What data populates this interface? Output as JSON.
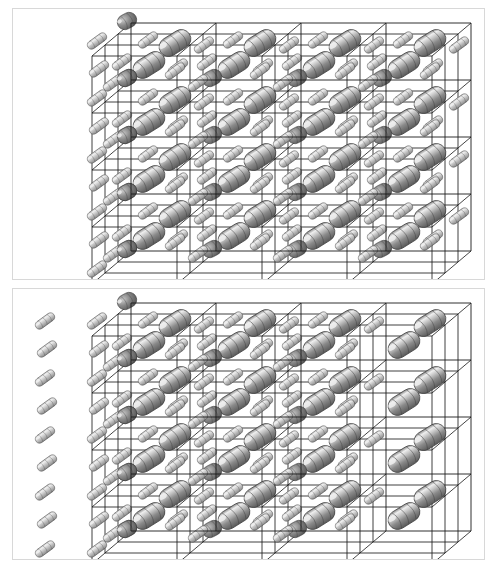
{
  "figure": {
    "title": "Crystal lattice packing diagrams",
    "width_px": 497,
    "height_px": 568,
    "background_color": "#ffffff",
    "frame_color": "#d8d8d8",
    "lattice_line_color": "#1a1a1a",
    "molecule_colors": {
      "body_dark": "#5a5a5a",
      "body_mid": "#8a8a8a",
      "body_light": "#c9c9c9",
      "highlight": "#efefef",
      "outline": "#3d3d3d",
      "node_dark": "#555555"
    }
  },
  "panels": [
    {
      "id": "panel-top",
      "label": "Upper packing diagram",
      "cells_across": 4,
      "cells_down": 4,
      "depth_layers": 4,
      "origin_x": 118,
      "origin_y": 14,
      "cell_w": 85,
      "cell_h": 57,
      "depth_dx": -13,
      "depth_dy": 11,
      "depth_step": 4,
      "big_rod": {
        "length": 34,
        "radius": 9.5,
        "angle_deg": -32,
        "offset_x": 44,
        "offset_y": 20,
        "bands": 4
      },
      "small_rod": {
        "length": 22,
        "radius": 4.2,
        "angle_deg": -36,
        "offset_x": 4,
        "offset_y": 34,
        "bands": 4
      },
      "node_rod": {
        "length": 20,
        "radius": 7.5,
        "angle_deg": -28,
        "offset_x": -4,
        "offset_y": -2,
        "bands": 3
      },
      "outside_small_rods": true,
      "outside_small_rod_columns": 1
    },
    {
      "id": "panel-bottom",
      "label": "Lower packing diagram",
      "cells_across": 4,
      "cells_down": 4,
      "depth_layers": 4,
      "origin_x": 118,
      "origin_y": 14,
      "cell_w": 85,
      "cell_h": 57,
      "depth_dx": -13,
      "depth_dy": 11,
      "depth_step": 4,
      "big_rod": {
        "length": 34,
        "radius": 9.5,
        "angle_deg": -32,
        "offset_x": 44,
        "offset_y": 20,
        "bands": 4
      },
      "small_rod": {
        "length": 22,
        "radius": 4.2,
        "angle_deg": -36,
        "offset_x": 4,
        "offset_y": 34,
        "bands": 4
      },
      "node_rod": {
        "length": 20,
        "radius": 7.5,
        "angle_deg": -28,
        "offset_x": -4,
        "offset_y": -2,
        "bands": 3
      },
      "outside_small_rods": true,
      "outside_small_rod_columns": 2,
      "last_column_big_only": true
    }
  ]
}
